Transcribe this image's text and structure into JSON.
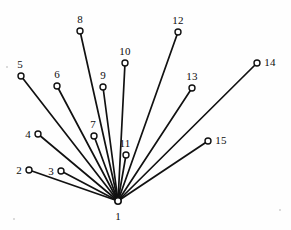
{
  "figure": {
    "background_color": "#fefefe",
    "line_color": "#111111",
    "node_fill_color": "#ffffff",
    "label_color": "#0d0d0d",
    "width": 291,
    "height": 230
  },
  "graph": {
    "hub_id": "1",
    "hub": {
      "label": "1",
      "cx": 118,
      "cy": 201,
      "r": 3.2,
      "label_x": 118,
      "label_y": 216
    },
    "nodes": [
      {
        "label": "2",
        "cx": 29,
        "cy": 170,
        "r": 3.0,
        "label_x": 19,
        "label_y": 170
      },
      {
        "label": "3",
        "cx": 61,
        "cy": 171,
        "r": 3.0,
        "label_x": 51,
        "label_y": 171
      },
      {
        "label": "4",
        "cx": 38,
        "cy": 134,
        "r": 3.0,
        "label_x": 28,
        "label_y": 134
      },
      {
        "label": "5",
        "cx": 21,
        "cy": 76,
        "r": 3.0,
        "label_x": 20,
        "label_y": 64
      },
      {
        "label": "6",
        "cx": 57,
        "cy": 86,
        "r": 3.0,
        "label_x": 57,
        "label_y": 74
      },
      {
        "label": "7",
        "cx": 94,
        "cy": 136,
        "r": 3.0,
        "label_x": 93,
        "label_y": 124
      },
      {
        "label": "8",
        "cx": 80,
        "cy": 31,
        "r": 3.0,
        "label_x": 80,
        "label_y": 19
      },
      {
        "label": "9",
        "cx": 103,
        "cy": 87,
        "r": 3.0,
        "label_x": 103,
        "label_y": 75
      },
      {
        "label": "10",
        "cx": 125,
        "cy": 63,
        "r": 3.0,
        "label_x": 125,
        "label_y": 51
      },
      {
        "label": "11",
        "cx": 126,
        "cy": 155,
        "r": 3.0,
        "label_x": 125,
        "label_y": 143
      },
      {
        "label": "12",
        "cx": 178,
        "cy": 32,
        "r": 3.0,
        "label_x": 178,
        "label_y": 20
      },
      {
        "label": "13",
        "cx": 192,
        "cy": 88,
        "r": 3.0,
        "label_x": 192,
        "label_y": 76
      },
      {
        "label": "14",
        "cx": 257,
        "cy": 63,
        "r": 3.0,
        "label_x": 270,
        "label_y": 62
      },
      {
        "label": "15",
        "cx": 208,
        "cy": 141,
        "r": 3.0,
        "label_x": 221,
        "label_y": 140
      }
    ],
    "edges": [
      {
        "from": "1",
        "to": "2"
      },
      {
        "from": "1",
        "to": "3"
      },
      {
        "from": "1",
        "to": "4"
      },
      {
        "from": "1",
        "to": "5"
      },
      {
        "from": "1",
        "to": "6"
      },
      {
        "from": "1",
        "to": "7"
      },
      {
        "from": "1",
        "to": "8"
      },
      {
        "from": "1",
        "to": "9"
      },
      {
        "from": "1",
        "to": "10"
      },
      {
        "from": "1",
        "to": "11"
      },
      {
        "from": "1",
        "to": "12"
      },
      {
        "from": "1",
        "to": "13"
      },
      {
        "from": "1",
        "to": "14"
      },
      {
        "from": "1",
        "to": "15"
      }
    ],
    "specks": [
      {
        "x": 6,
        "y": 66
      },
      {
        "x": 13,
        "y": 218
      },
      {
        "x": 279,
        "y": 209
      }
    ]
  }
}
